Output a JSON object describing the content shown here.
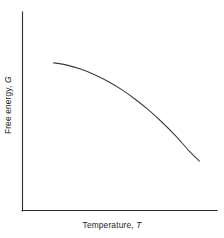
{
  "figure": {
    "background_color": "#ffffff",
    "line_color": "#3a3a3a",
    "axis_color": "#2b2b2b"
  },
  "axes": {
    "x_label_text": "Temperature, ",
    "x_label_variable": "T",
    "y_label_text": "Free energy, ",
    "y_label_variable": "G"
  },
  "chart_data": {
    "type": "line",
    "title": "",
    "xlabel": "Temperature, T",
    "ylabel": "Free energy, G",
    "xlim": [
      0,
      1
    ],
    "ylim": [
      0,
      1
    ],
    "grid": false,
    "legend": null,
    "tick_labels_x": [],
    "tick_labels_y": [],
    "annotations": [],
    "series": [
      {
        "name": "Free energy",
        "x": [
          0.09,
          0.17,
          0.25,
          0.33,
          0.41,
          0.49,
          0.57,
          0.65,
          0.73,
          0.81,
          0.89,
          0.95
        ],
        "y": [
          0.745,
          0.733,
          0.713,
          0.686,
          0.652,
          0.611,
          0.563,
          0.508,
          0.446,
          0.377,
          0.301,
          0.25
        ]
      }
    ]
  }
}
